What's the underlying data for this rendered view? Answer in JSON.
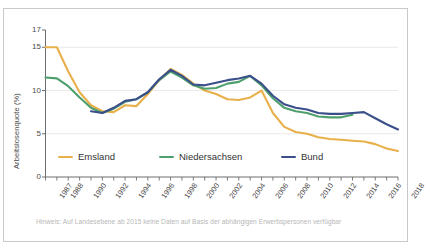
{
  "frame": {
    "border_color": "#c9c9c9",
    "background": "#ffffff"
  },
  "note": {
    "text": "Hinweis: Auf Landesebene ab 2015 keine Daten auf Basis der abhängigen Erwerbspersonen verfügbar",
    "color": "#b7b7b7"
  },
  "legend": [
    {
      "label": "Emsland",
      "color": "#E8B04B"
    },
    {
      "label": "Niedersachsen",
      "color": "#4E9F6E"
    },
    {
      "label": "Bund",
      "color": "#3B4F8A"
    }
  ],
  "axis": {
    "y_label": "Arbeitslosenquote (%)",
    "y_ticks": [
      0,
      5,
      10,
      15,
      17
    ],
    "gridlines": [
      5,
      10,
      15
    ],
    "x_ticks": [
      "1987",
      "1988",
      "1990",
      "1992",
      "1994",
      "1996",
      "1998",
      "2000",
      "2002",
      "2004",
      "2006",
      "2008",
      "2010",
      "2012",
      "2014",
      "2016",
      "2018"
    ]
  },
  "chart_data": {
    "type": "line",
    "title": "",
    "xlabel": "",
    "ylabel": "Arbeitslosenquote (%)",
    "xlim": [
      1987,
      2018
    ],
    "ylim": [
      0,
      17
    ],
    "grid": true,
    "legend_position": "bottom-left",
    "x": [
      1987,
      1988,
      1989,
      1990,
      1991,
      1992,
      1993,
      1994,
      1995,
      1996,
      1997,
      1998,
      1999,
      2000,
      2001,
      2002,
      2003,
      2004,
      2005,
      2006,
      2007,
      2008,
      2009,
      2010,
      2011,
      2012,
      2013,
      2014,
      2015,
      2016,
      2017,
      2018
    ],
    "series": [
      {
        "name": "Emsland",
        "color": "#E8B04B",
        "values": [
          15.0,
          15.0,
          12.2,
          9.8,
          8.3,
          7.6,
          7.5,
          8.3,
          8.2,
          9.6,
          11.2,
          12.5,
          11.8,
          10.8,
          10.0,
          9.6,
          9.0,
          8.9,
          9.2,
          10.0,
          7.4,
          5.8,
          5.2,
          5.0,
          4.6,
          4.4,
          4.3,
          4.2,
          4.1,
          3.8,
          3.3,
          3.0
        ]
      },
      {
        "name": "Niedersachsen",
        "color": "#4E9F6E",
        "values": [
          11.5,
          11.4,
          10.5,
          9.2,
          8.0,
          7.4,
          7.9,
          8.7,
          9.0,
          9.8,
          11.2,
          12.2,
          11.5,
          10.6,
          10.2,
          10.3,
          10.8,
          11.0,
          11.7,
          10.6,
          9.1,
          8.0,
          7.6,
          7.4,
          7.0,
          6.9,
          6.9,
          7.2,
          null,
          null,
          null,
          null
        ]
      },
      {
        "name": "Bund",
        "color": "#3B4F8A",
        "values": [
          null,
          null,
          null,
          null,
          7.6,
          7.4,
          8.0,
          8.8,
          9.0,
          9.8,
          11.3,
          12.4,
          11.7,
          10.7,
          10.6,
          10.9,
          11.2,
          11.4,
          11.7,
          10.8,
          9.4,
          8.4,
          8.0,
          7.8,
          7.4,
          7.3,
          7.3,
          7.4,
          7.5,
          6.8,
          6.1,
          5.5
        ]
      }
    ]
  }
}
